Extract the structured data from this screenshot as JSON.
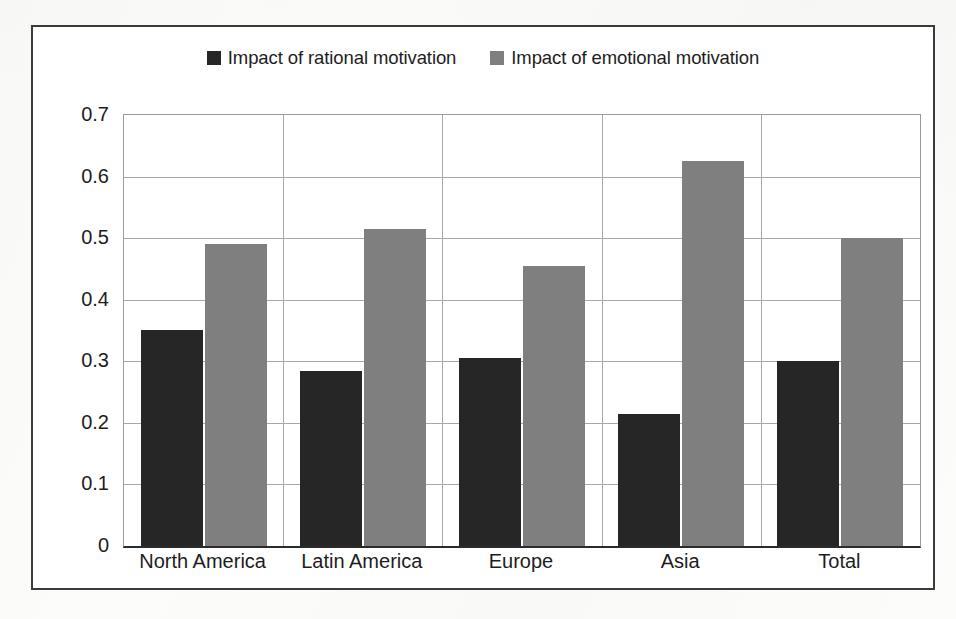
{
  "chart_data": {
    "type": "bar",
    "title": "",
    "subtitle": "",
    "xlabel": "",
    "ylabel": "",
    "categories": [
      "North America",
      "Latin America",
      "Europe",
      "Asia",
      "Total"
    ],
    "series": [
      {
        "name": "Impact of rational motivation",
        "color": "#262626",
        "values": [
          0.35,
          0.285,
          0.305,
          0.215,
          0.3
        ]
      },
      {
        "name": "Impact of emotional motivation",
        "color": "#7f7f7f",
        "values": [
          0.49,
          0.515,
          0.455,
          0.625,
          0.5
        ]
      }
    ],
    "ylim": [
      0,
      0.7
    ],
    "yticks": [
      0,
      0.1,
      0.2,
      0.3,
      0.4,
      0.5,
      0.6,
      0.7
    ],
    "ytick_labels": [
      "0",
      "0.1",
      "0.2",
      "0.3",
      "0.4",
      "0.5",
      "0.6",
      "0.7"
    ],
    "grid": true,
    "grid_axis": "y",
    "legend_position": "top-center",
    "annotations": []
  },
  "legend": {
    "entries": [
      {
        "label": "Impact of rational motivation",
        "swatch_color": "#262626",
        "swatch_name": "legend-swatch-rational"
      },
      {
        "label": "Impact of emotional motivation",
        "swatch_color": "#7f7f7f",
        "swatch_name": "legend-swatch-emotional"
      }
    ]
  },
  "colors": {
    "series_rational": "#262626",
    "series_emotional": "#7f7f7f",
    "frame_border": "#3b3b3b",
    "gridline": "#a8a8a8",
    "axis_baseline": "#2b2b2b",
    "plot_background": "#ffffff",
    "page_background": "#fcfcfa",
    "text": "#1d1d1d"
  }
}
